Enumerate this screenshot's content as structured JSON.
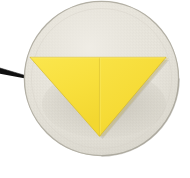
{
  "scene": {
    "title": "Yellow folded triangle napkin on round grey plate",
    "width": 190,
    "height": 178,
    "background_color": "#FFFFFF"
  },
  "plate": {
    "label": "Round grey plate",
    "center_x": 101.5,
    "center_y": 78.5,
    "radius": 77.5,
    "fill_color": "#E6E3DA",
    "rim_color": "#B9B6AC",
    "shadow_color": "#D7D4C9",
    "texture_color": "#DBD8CE"
  },
  "napkin": {
    "label": "Yellow folded triangle napkin",
    "fill_color": "#F8DF3C",
    "fill_color_right": "#F6DB36",
    "edge_color": "#D9BF2A",
    "crease_color": "#E8CE33",
    "vertices": {
      "left": {
        "x": 30,
        "y": 57.5
      },
      "right": {
        "x": 166,
        "y": 57.5
      },
      "bottom": {
        "x": 99.5,
        "y": 136
      },
      "crease_top": {
        "x": 99.5,
        "y": 57.5
      }
    }
  },
  "cable": {
    "label": "Black cable",
    "color": "#101010",
    "start_x": 0,
    "start_y": 70.5,
    "end_x": 30,
    "end_y": 78.5,
    "start_width": 5.5,
    "end_width": 2.0
  },
  "icons": {
    "plate": "circle-plate-icon",
    "napkin": "triangle-napkin-icon",
    "cable": "cable-icon"
  }
}
